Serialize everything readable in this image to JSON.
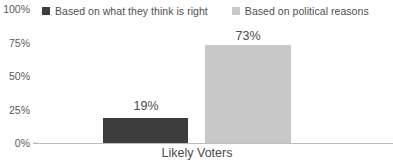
{
  "chart_data": {
    "type": "bar",
    "title": "",
    "xlabel": "",
    "ylabel": "",
    "categories": [
      "Likely Voters"
    ],
    "series": [
      {
        "name": "Based on what they think is right",
        "values": [
          19
        ],
        "color": "#3d3d3d",
        "value_labels": [
          "19%"
        ]
      },
      {
        "name": "Based on political reasons",
        "values": [
          73
        ],
        "color": "#c8c8c8",
        "value_labels": [
          "73%"
        ]
      }
    ],
    "ylim": [
      0,
      100
    ],
    "yticks": [
      100,
      75,
      50,
      25,
      0
    ],
    "ytick_labels": [
      "100%",
      "75%",
      "50%",
      "25%",
      "0%"
    ],
    "grid": false,
    "legend_position": "top"
  },
  "legend": {
    "items": [
      {
        "label": "Based on what they think is right",
        "swatch_color": "#3d3d3d"
      },
      {
        "label": "Based on political reasons",
        "swatch_color": "#c8c8c8"
      }
    ]
  },
  "axis": {
    "y_labels": [
      "100%",
      "75%",
      "50%",
      "25%",
      "0%"
    ],
    "category_label": "Likely Voters"
  },
  "bars": [
    {
      "value_label": "19%",
      "color": "#3d3d3d"
    },
    {
      "value_label": "73%",
      "color": "#c8c8c8"
    }
  ]
}
